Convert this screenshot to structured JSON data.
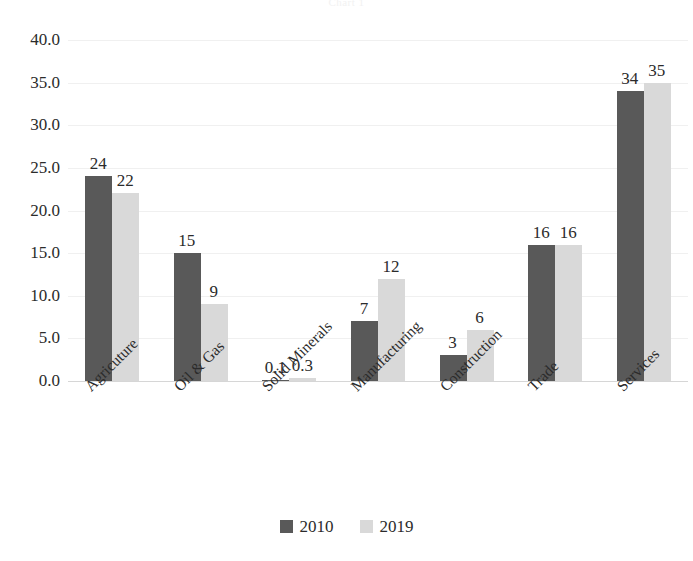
{
  "chart_data": {
    "type": "bar",
    "title": "Chart 1",
    "xlabel": "",
    "ylabel": "",
    "ylim": [
      0,
      40
    ],
    "ytick_step": 5,
    "grid": true,
    "legend_position": "bottom",
    "categories": [
      "Agricuture",
      "Oil & Gas",
      "Solid Minerals",
      "Manufacturing",
      "Construction",
      "Trade",
      "Services"
    ],
    "series": [
      {
        "name": "2010",
        "color": "#595959",
        "values": [
          24,
          15,
          0.1,
          7,
          3,
          16,
          34
        ],
        "labels": [
          "24",
          "15",
          "0.1",
          "7",
          "3",
          "16",
          "34"
        ]
      },
      {
        "name": "2019",
        "color": "#d9d9d9",
        "values": [
          22,
          9,
          0.3,
          12,
          6,
          16,
          35
        ],
        "labels": [
          "22",
          "9",
          "0.3",
          "12",
          "6",
          "16",
          "35"
        ]
      }
    ],
    "ytick_labels": [
      "40.0",
      "35.0",
      "30.0",
      "25.0",
      "20.0",
      "15.0",
      "10.0",
      "5.0",
      "0.0"
    ],
    "ytick_values": [
      40,
      35,
      30,
      25,
      20,
      15,
      10,
      5,
      0
    ]
  },
  "legend": {
    "items": [
      {
        "label": "2010",
        "color": "#595959"
      },
      {
        "label": "2019",
        "color": "#d9d9d9"
      }
    ]
  },
  "colors": {
    "series_2010": "#595959",
    "series_2019": "#d9d9d9",
    "gridline": "#f0f0f0",
    "axis": "#d6d6d6",
    "text": "#2b2b2b",
    "background": "#ffffff"
  }
}
